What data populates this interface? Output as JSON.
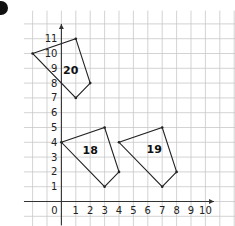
{
  "exercise": {
    "bullet_color": "#111111",
    "grid": {
      "origin_px": [
        61.4,
        201.5
      ],
      "unit_px_x": 14.4,
      "unit_px_y": 14.8,
      "x_min": -3,
      "x_max": 11,
      "y_min": -1,
      "y_max": 13,
      "line_color": "#c8c8c8",
      "axis_color": "#333333"
    },
    "axes": {
      "x_tick_labels": [
        "0",
        "1",
        "2",
        "3",
        "4",
        "5",
        "6",
        "7",
        "8",
        "9",
        "10"
      ],
      "y_tick_labels": [
        "1",
        "2",
        "3",
        "4",
        "5",
        "6",
        "7",
        "8",
        "9",
        "10",
        "11"
      ]
    },
    "shapes": [
      {
        "label": "20",
        "vertices": [
          [
            -2,
            10
          ],
          [
            1,
            11
          ],
          [
            2,
            8
          ],
          [
            1,
            7
          ]
        ],
        "label_pos": [
          0.65,
          8.9
        ]
      },
      {
        "label": "18",
        "vertices": [
          [
            0,
            4
          ],
          [
            3,
            5
          ],
          [
            4,
            2
          ],
          [
            3,
            1
          ]
        ],
        "label_pos": [
          2.0,
          3.5
        ]
      },
      {
        "label": "19",
        "vertices": [
          [
            4,
            4
          ],
          [
            7,
            5
          ],
          [
            8,
            2
          ],
          [
            7,
            1
          ]
        ],
        "label_pos": [
          6.45,
          3.55
        ]
      }
    ]
  },
  "chart_data": {
    "type": "scatter",
    "title": "",
    "xlabel": "",
    "ylabel": "",
    "x_ticks": [
      0,
      1,
      2,
      3,
      4,
      5,
      6,
      7,
      8,
      9,
      10
    ],
    "y_ticks": [
      0,
      1,
      2,
      3,
      4,
      5,
      6,
      7,
      8,
      9,
      10,
      11
    ],
    "grid": true,
    "series": [
      {
        "name": "20",
        "points": [
          [
            -2,
            10
          ],
          [
            1,
            11
          ],
          [
            2,
            8
          ],
          [
            1,
            7
          ]
        ],
        "closed": true
      },
      {
        "name": "18",
        "points": [
          [
            0,
            4
          ],
          [
            3,
            5
          ],
          [
            4,
            2
          ],
          [
            3,
            1
          ]
        ],
        "closed": true
      },
      {
        "name": "19",
        "points": [
          [
            4,
            4
          ],
          [
            7,
            5
          ],
          [
            8,
            2
          ],
          [
            7,
            1
          ]
        ],
        "closed": true
      }
    ]
  }
}
